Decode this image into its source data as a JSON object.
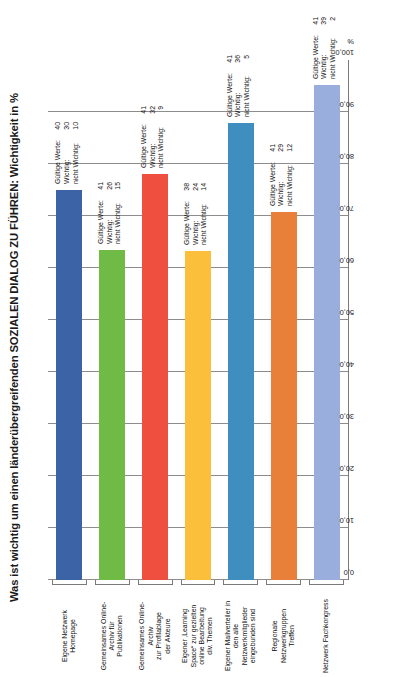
{
  "chart_data": {
    "type": "bar",
    "title": "Was ist wichtig um einen länderübergreifenden SOZIALEN DIALOG ZU FÜHREN: Wichtigkeit in %",
    "xlabel": "",
    "ylabel": "%",
    "orientation": "horizontal",
    "unit": "%",
    "axis_unit_symbol": "%",
    "ylim": [
      0,
      100
    ],
    "tick_labels": [
      "100,0",
      "90,0",
      "80,0",
      "70,0",
      "60,0",
      "50,0",
      "40,0",
      "30,0",
      "20,0",
      "10,0",
      "0,0"
    ],
    "tick_values": [
      100,
      90,
      80,
      70,
      60,
      50,
      40,
      30,
      20,
      10,
      0
    ],
    "grid": true,
    "legend": "none",
    "annotation_labels": {
      "valid": "Gültige Werte:",
      "important": "Wichtig:",
      "not_important": "nicht Wichtig:"
    },
    "categories": [
      "Eigene Netzwerk Homepage",
      "Gemeinsames Online-Archiv für Publikationen",
      "Gemeinsames Online-Archiv zur Profilablage der Akteure",
      "Eigener ‚Learning Space“ zur gezielten online Bearbeitung div. Themen",
      "Eigener Mailverteiler in den alle Netzwerkmitglieder eingebunden sind",
      "Regionale Netzwerkgruppen Treffen",
      "Netzwerk Fachkongress"
    ],
    "category_lines": [
      [
        "Eigene Netzwerk",
        "Homepage"
      ],
      [
        "Gemeinsames Online-",
        "Archiv für",
        "Publikationen"
      ],
      [
        "Gemeinsames Online-",
        "Archiv",
        "zur Profilablage",
        "der Akteure"
      ],
      [
        "Eigener ‚Learning",
        "Space“ zur gezielten",
        "online Bearbeitung",
        "div. Themen"
      ],
      [
        "Eigener Mailverteiler in",
        "den alle",
        "Netzwerkmitglieder",
        "eingebunden sind"
      ],
      [
        "Regionale",
        "Netzwerkgruppen",
        "Treffen"
      ],
      [
        "Netzwerk Fachkongress"
      ]
    ],
    "values": [
      75.0,
      63.4,
      78.0,
      63.2,
      87.8,
      70.7,
      95.1
    ],
    "bars": [
      {
        "category": "Eigene Netzwerk Homepage",
        "valid": "40",
        "important": "30",
        "not_important": "10",
        "percent": 75.0,
        "color": "#3b63a5"
      },
      {
        "category": "Gemeinsames Online-Archiv für Publikationen",
        "valid": "41",
        "important": "26",
        "not_important": "15",
        "percent": 63.4,
        "color": "#6fbb45"
      },
      {
        "category": "Gemeinsames Online-Archiv zur Profilablage der Akteure",
        "valid": "41",
        "important": "32",
        "not_important": "9",
        "percent": 78.0,
        "color": "#ee4f3e"
      },
      {
        "category": "Eigener ‚Learning Space“ zur gezielten online Bearbeitung div. Themen",
        "valid": "38",
        "important": "24",
        "not_important": "14",
        "percent": 63.2,
        "color": "#fbbf3c"
      },
      {
        "category": "Eigener Mailverteiler in den alle Netzwerkmitglieder eingebunden sind",
        "valid": "41",
        "important": "36",
        "not_important": "5",
        "percent": 87.8,
        "color": "#3e8fc0"
      },
      {
        "category": "Regionale Netzwerkgruppen Treffen",
        "valid": "41",
        "important": "29",
        "not_important": "12",
        "percent": 70.7,
        "color": "#e8803a"
      },
      {
        "category": "Netzwerk Fachkongress",
        "valid": "41",
        "important": "39",
        "not_important": "2",
        "percent": 95.1,
        "color": "#9aaedd"
      }
    ]
  }
}
